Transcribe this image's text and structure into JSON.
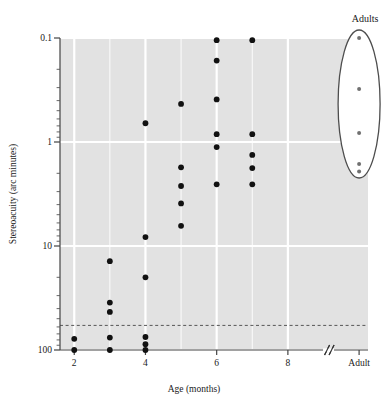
{
  "chart_data": {
    "type": "scatter",
    "title": "",
    "xlabel": "Age (months)",
    "ylabel": "Stereoacuity (arc minutes)",
    "x_tick_labels": [
      "2",
      "4",
      "6",
      "8",
      "Adult"
    ],
    "x_tick_values": [
      2,
      4,
      6,
      8,
      10
    ],
    "x_axis_break": true,
    "x_axis_break_label": "//",
    "xlim": [
      1.6,
      10.25
    ],
    "y_scale": "log-inverted",
    "y_tick_labels": [
      "0.1",
      "1",
      "10",
      "100"
    ],
    "y_tick_values": [
      0.1,
      1,
      10,
      100
    ],
    "ylim": [
      0.1,
      100
    ],
    "grid": true,
    "grid_color": "#ffffff",
    "plot_bg_color": "#e2e2e2",
    "point_color": "#111111",
    "adult_point_color": "#707070",
    "threshold_line": {
      "value": 58,
      "style": "dashed",
      "color": "#555555"
    },
    "annotations": [
      {
        "label": "Adults",
        "x": 10,
        "shape": "ellipse"
      }
    ],
    "series": [
      {
        "name": "Infant stereoacuity",
        "points": [
          {
            "age": 2,
            "acuity": 78
          },
          {
            "age": 2,
            "acuity": 100
          },
          {
            "age": 3,
            "acuity": 14
          },
          {
            "age": 3,
            "acuity": 35
          },
          {
            "age": 3,
            "acuity": 43
          },
          {
            "age": 3,
            "acuity": 76
          },
          {
            "age": 3,
            "acuity": 100
          },
          {
            "age": 4,
            "acuity": 0.66
          },
          {
            "age": 4,
            "acuity": 8.2
          },
          {
            "age": 4,
            "acuity": 20
          },
          {
            "age": 4,
            "acuity": 75
          },
          {
            "age": 4,
            "acuity": 88
          },
          {
            "age": 4,
            "acuity": 100
          },
          {
            "age": 5,
            "acuity": 0.43
          },
          {
            "age": 5,
            "acuity": 1.75
          },
          {
            "age": 5,
            "acuity": 2.65
          },
          {
            "age": 5,
            "acuity": 3.9
          },
          {
            "age": 5,
            "acuity": 6.4
          },
          {
            "age": 6,
            "acuity": 0.105
          },
          {
            "age": 6,
            "acuity": 0.165
          },
          {
            "age": 6,
            "acuity": 0.39
          },
          {
            "age": 6,
            "acuity": 0.84
          },
          {
            "age": 6,
            "acuity": 1.12
          },
          {
            "age": 6,
            "acuity": 2.55
          },
          {
            "age": 7,
            "acuity": 0.105
          },
          {
            "age": 7,
            "acuity": 0.84
          },
          {
            "age": 7,
            "acuity": 1.33
          },
          {
            "age": 7,
            "acuity": 1.78
          },
          {
            "age": 7,
            "acuity": 2.55
          }
        ]
      },
      {
        "name": "Adults",
        "points": [
          {
            "age": 10,
            "acuity": 0.1
          },
          {
            "age": 10,
            "acuity": 0.31
          },
          {
            "age": 10,
            "acuity": 0.82
          },
          {
            "age": 10,
            "acuity": 1.63
          },
          {
            "age": 10,
            "acuity": 1.92
          }
        ]
      }
    ]
  }
}
